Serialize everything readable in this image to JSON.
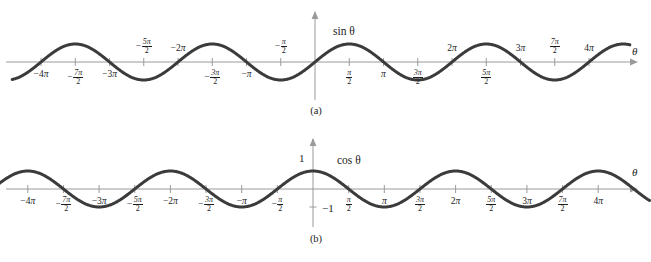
{
  "figure": {
    "background_color": "#ffffff",
    "curve_color": "#3b3b3b",
    "axis_color": "#9a9a9a",
    "text_color": "#1d1d1d"
  },
  "chart_data": [
    {
      "type": "line",
      "title": "",
      "curve_label": "sin θ",
      "xlabel": "θ",
      "ylabel": "",
      "xlim": [
        -4.4,
        4.6
      ],
      "ylim": [
        -1.45,
        1.45
      ],
      "x_unit": "pi",
      "grid": false,
      "legend_position": "inline-above-curve",
      "function": "sin",
      "amplitude": 1,
      "period_in_pi": 2,
      "zero_crossings_pi": [
        -4,
        -3,
        -2,
        -1,
        0,
        1,
        2,
        3,
        4
      ],
      "maxima_pi": [
        -3.5,
        -1.5,
        0.5,
        2.5,
        4.5
      ],
      "minima_pi": [
        -2.5,
        -0.5,
        1.5,
        3.5
      ],
      "y_axis_labels": [],
      "xticks": [
        {
          "value_pi": -4,
          "label": "-4π",
          "kind": "plain",
          "minus": true,
          "whole": "4",
          "num": "",
          "den": "",
          "side": "below"
        },
        {
          "value_pi": -3.5,
          "label": "-7π/2",
          "kind": "frac",
          "minus": true,
          "whole": "",
          "num": "7π",
          "den": "2",
          "side": "below"
        },
        {
          "value_pi": -3,
          "label": "-3π",
          "kind": "plain",
          "minus": true,
          "whole": "3",
          "num": "",
          "den": "",
          "side": "below"
        },
        {
          "value_pi": -2.5,
          "label": "-5π/2",
          "kind": "frac",
          "minus": true,
          "whole": "",
          "num": "5π",
          "den": "2",
          "side": "above"
        },
        {
          "value_pi": -2,
          "label": "-2π",
          "kind": "plain",
          "minus": true,
          "whole": "2",
          "num": "",
          "den": "",
          "side": "above"
        },
        {
          "value_pi": -1.5,
          "label": "-3π/2",
          "kind": "frac",
          "minus": true,
          "whole": "",
          "num": "3π",
          "den": "2",
          "side": "below"
        },
        {
          "value_pi": -1,
          "label": "-π",
          "kind": "plain",
          "minus": true,
          "whole": "",
          "num": "",
          "den": "",
          "side": "below"
        },
        {
          "value_pi": -0.5,
          "label": "-π/2",
          "kind": "frac",
          "minus": true,
          "whole": "",
          "num": "π",
          "den": "2",
          "side": "above"
        },
        {
          "value_pi": 0.5,
          "label": "π/2",
          "kind": "frac",
          "minus": false,
          "whole": "",
          "num": "π",
          "den": "2",
          "side": "below"
        },
        {
          "value_pi": 1,
          "label": "π",
          "kind": "plain",
          "minus": false,
          "whole": "",
          "num": "",
          "den": "",
          "side": "below"
        },
        {
          "value_pi": 1.5,
          "label": "3π/2",
          "kind": "frac",
          "minus": false,
          "whole": "",
          "num": "3π",
          "den": "2",
          "side": "below"
        },
        {
          "value_pi": 2,
          "label": "2π",
          "kind": "plain",
          "minus": false,
          "whole": "2",
          "num": "",
          "den": "",
          "side": "above"
        },
        {
          "value_pi": 2.5,
          "label": "5π/2",
          "kind": "frac",
          "minus": false,
          "whole": "",
          "num": "5π",
          "den": "2",
          "side": "below"
        },
        {
          "value_pi": 3,
          "label": "3π",
          "kind": "plain",
          "minus": false,
          "whole": "3",
          "num": "",
          "den": "",
          "side": "above"
        },
        {
          "value_pi": 3.5,
          "label": "7π/2",
          "kind": "frac",
          "minus": false,
          "whole": "",
          "num": "7π",
          "den": "2",
          "side": "above"
        },
        {
          "value_pi": 4,
          "label": "4π",
          "kind": "plain",
          "minus": false,
          "whole": "4",
          "num": "",
          "den": "",
          "side": "above"
        }
      ],
      "caption": "(a)"
    },
    {
      "type": "line",
      "title": "",
      "curve_label": "cos θ",
      "xlabel": "θ",
      "ylabel": "",
      "xlim": [
        -4.55,
        4.75
      ],
      "ylim": [
        -1.45,
        1.45
      ],
      "x_unit": "pi",
      "grid": false,
      "legend_position": "inline-right-of-peak",
      "function": "cos",
      "amplitude": 1,
      "period_in_pi": 2,
      "zero_crossings_pi": [
        -3.5,
        -2.5,
        -1.5,
        -0.5,
        0.5,
        1.5,
        2.5,
        3.5
      ],
      "maxima_pi": [
        -4,
        -2,
        0,
        2,
        4
      ],
      "minima_pi": [
        -3,
        -1,
        1,
        3
      ],
      "y_axis_labels": [
        {
          "value": 1,
          "label": "1"
        },
        {
          "value": -1,
          "label": "-1"
        }
      ],
      "xticks": [
        {
          "value_pi": -4,
          "label": "-4π",
          "kind": "plain",
          "minus": true,
          "whole": "4",
          "num": "",
          "den": "",
          "side": "below"
        },
        {
          "value_pi": -3.5,
          "label": "-7π/2",
          "kind": "frac",
          "minus": true,
          "whole": "",
          "num": "7π",
          "den": "2",
          "side": "below"
        },
        {
          "value_pi": -3,
          "label": "-3π",
          "kind": "plain",
          "minus": true,
          "whole": "3",
          "num": "",
          "den": "",
          "side": "below"
        },
        {
          "value_pi": -2.5,
          "label": "-5π/2",
          "kind": "frac",
          "minus": true,
          "whole": "",
          "num": "5π",
          "den": "2",
          "side": "below"
        },
        {
          "value_pi": -2,
          "label": "-2π",
          "kind": "plain",
          "minus": true,
          "whole": "2",
          "num": "",
          "den": "",
          "side": "below"
        },
        {
          "value_pi": -1.5,
          "label": "-3π/2",
          "kind": "frac",
          "minus": true,
          "whole": "",
          "num": "3π",
          "den": "2",
          "side": "below"
        },
        {
          "value_pi": -1,
          "label": "-π",
          "kind": "plain",
          "minus": true,
          "whole": "",
          "num": "",
          "den": "",
          "side": "below"
        },
        {
          "value_pi": -0.5,
          "label": "-π/2",
          "kind": "frac",
          "minus": true,
          "whole": "",
          "num": "π",
          "den": "2",
          "side": "below"
        },
        {
          "value_pi": 0.5,
          "label": "π/2",
          "kind": "frac",
          "minus": false,
          "whole": "",
          "num": "π",
          "den": "2",
          "side": "below"
        },
        {
          "value_pi": 1,
          "label": "π",
          "kind": "plain",
          "minus": false,
          "whole": "",
          "num": "",
          "den": "",
          "side": "below"
        },
        {
          "value_pi": 1.5,
          "label": "3π/2",
          "kind": "frac",
          "minus": false,
          "whole": "",
          "num": "3π",
          "den": "2",
          "side": "below"
        },
        {
          "value_pi": 2,
          "label": "2π",
          "kind": "plain",
          "minus": false,
          "whole": "2",
          "num": "",
          "den": "",
          "side": "below"
        },
        {
          "value_pi": 2.5,
          "label": "5π/2",
          "kind": "frac",
          "minus": false,
          "whole": "",
          "num": "5π",
          "den": "2",
          "side": "below"
        },
        {
          "value_pi": 3,
          "label": "3π",
          "kind": "plain",
          "minus": false,
          "whole": "3",
          "num": "",
          "den": "",
          "side": "below"
        },
        {
          "value_pi": 3.5,
          "label": "7π/2",
          "kind": "frac",
          "minus": false,
          "whole": "",
          "num": "7π",
          "den": "2",
          "side": "below"
        },
        {
          "value_pi": 4,
          "label": "4π",
          "kind": "plain",
          "minus": false,
          "whole": "4",
          "num": "",
          "den": "",
          "side": "below"
        }
      ],
      "caption": "(b)"
    }
  ]
}
